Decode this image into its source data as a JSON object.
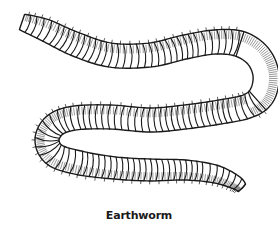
{
  "illustration": {
    "subject": "earthworm",
    "style": "black line art on white",
    "ink_color": "#1a1a1a",
    "background_color": "#ffffff"
  },
  "caption": "Earthworm"
}
